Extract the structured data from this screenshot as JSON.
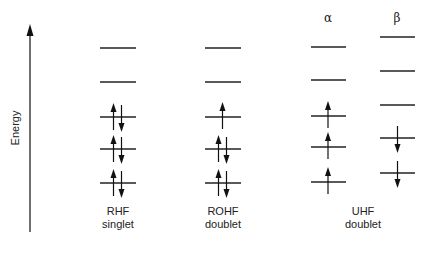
{
  "axis": {
    "label": "Energy"
  },
  "panels": [
    {
      "id": "rhf",
      "title": "RHF",
      "subtitle": "singlet",
      "columns": [
        {
          "header": "",
          "levels": [
            {
              "occupancy": "empty"
            },
            {
              "occupancy": "empty"
            },
            {
              "occupancy": "up-down"
            },
            {
              "occupancy": "up-down"
            },
            {
              "occupancy": "up-down"
            }
          ]
        }
      ]
    },
    {
      "id": "rohf",
      "title": "ROHF",
      "subtitle": "doublet",
      "columns": [
        {
          "header": "",
          "levels": [
            {
              "occupancy": "empty"
            },
            {
              "occupancy": "empty"
            },
            {
              "occupancy": "up"
            },
            {
              "occupancy": "up-down"
            },
            {
              "occupancy": "up-down"
            }
          ]
        }
      ]
    },
    {
      "id": "uhf",
      "title": "UHF",
      "subtitle": "doublet",
      "columns": [
        {
          "header": "α",
          "levels": [
            {
              "occupancy": "empty"
            },
            {
              "occupancy": "empty"
            },
            {
              "occupancy": "up"
            },
            {
              "occupancy": "up"
            },
            {
              "occupancy": "up"
            }
          ]
        },
        {
          "header": "β",
          "levels": [
            {
              "occupancy": "empty"
            },
            {
              "occupancy": "empty"
            },
            {
              "occupancy": "empty"
            },
            {
              "occupancy": "down"
            },
            {
              "occupancy": "down"
            }
          ]
        }
      ]
    }
  ]
}
